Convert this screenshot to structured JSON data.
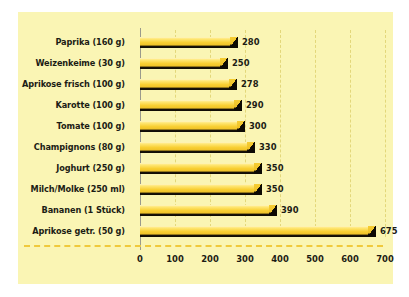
{
  "chart_data": {
    "type": "bar",
    "orientation": "horizontal",
    "title": "",
    "subtitle": "",
    "xlabel": "",
    "ylabel": "",
    "xlim": [
      0,
      700
    ],
    "xticks": [
      0,
      100,
      200,
      300,
      400,
      500,
      600,
      700
    ],
    "xtick_labels": [
      "0",
      "100",
      "200",
      "300",
      "400",
      "500",
      "600",
      "700"
    ],
    "grid": "vertical-dashed",
    "legend": "none",
    "categories": [
      "Paprika (160 g)",
      "Weizenkeime (30 g)",
      "Aprikose frisch (100 g)",
      "Karotte (100 g)",
      "Tomate (100 g)",
      "Champignons (80 g)",
      "Joghurt (250 g)",
      "Milch/Molke (250 ml)",
      "Bananen (1 Stück)",
      "Aprikose getr. (50 g)"
    ],
    "values": [
      280,
      250,
      278,
      290,
      300,
      330,
      350,
      350,
      390,
      675
    ],
    "value_labels": [
      "280",
      "250",
      "278",
      "290",
      "300",
      "330",
      "350",
      "350",
      "390",
      "675"
    ],
    "colors": {
      "background": "#faf5b4",
      "bar_highlight": "#fdf6c8",
      "bar_fill": "#f8cf33",
      "bar_shadow": "#0d0a04",
      "gridline": "#e3d77a",
      "axis_line": "#9a9a8c",
      "baseline_dashed": "#f0c93c",
      "text": "#1c1c14"
    }
  }
}
